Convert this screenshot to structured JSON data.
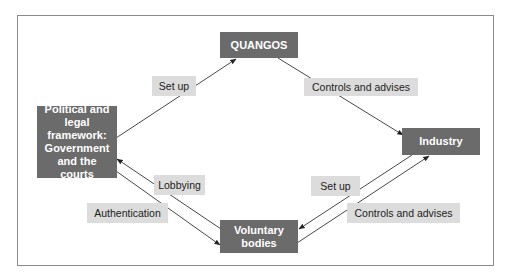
{
  "diagram": {
    "colors": {
      "node_fill": "#6b6b6b",
      "node_text": "#ffffff",
      "label_fill": "#dcdcdc",
      "label_text": "#222222",
      "line": "#333333",
      "frame": "#8a8a8a"
    },
    "nodes": {
      "quangos": "QUANGOS",
      "political": "Political and legal framework: Government and the courts",
      "industry": "Industry",
      "voluntary": "Voluntary bodies"
    },
    "edges": [
      {
        "from": "political",
        "to": "quangos",
        "label": "Set up"
      },
      {
        "from": "quangos",
        "to": "industry",
        "label": "Controls and advises"
      },
      {
        "from": "voluntary",
        "to": "political",
        "label": "Lobbying"
      },
      {
        "from": "political",
        "to": "voluntary",
        "label": "Authentication"
      },
      {
        "from": "industry",
        "to": "voluntary",
        "label": "Set up"
      },
      {
        "from": "voluntary",
        "to": "industry",
        "label": "Controls and advises"
      }
    ]
  }
}
